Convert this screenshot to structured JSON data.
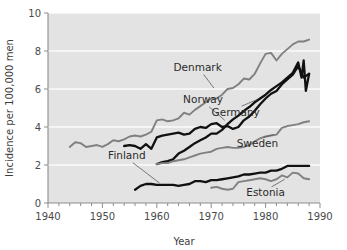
{
  "chart_data": {
    "type": "line",
    "title": "",
    "xlabel": "Year",
    "ylabel": "Incidence per 100,000 men",
    "xlim": [
      1940,
      1990
    ],
    "ylim": [
      0,
      10
    ],
    "xticks": [
      1940,
      1950,
      1960,
      1970,
      1980,
      1990
    ],
    "xtick_labels": [
      "1940",
      "1950",
      "1960",
      "1970",
      "1980",
      "1990"
    ],
    "yticks": [
      0,
      2,
      4,
      6,
      8,
      10
    ],
    "ytick_labels": [
      "0",
      "2",
      "4",
      "6",
      "8",
      "10"
    ],
    "minor_xtick_interval": 2,
    "grid": "horizontal-white",
    "legend": "inline-annotations",
    "plot_background": "#e3e3e3",
    "figure_background": "#ffffff",
    "series": [
      {
        "name": "Denmark",
        "color": "#808080",
        "label_x": 1967.5,
        "label_y": 6.95,
        "leader_to_x": 1970.5,
        "leader_to_y": 6.05,
        "x": [
          1944,
          1945,
          1946,
          1947,
          1948,
          1949,
          1950,
          1951,
          1952,
          1953,
          1954,
          1955,
          1956,
          1957,
          1958,
          1959,
          1960,
          1961,
          1962,
          1963,
          1964,
          1965,
          1966,
          1967,
          1968,
          1969,
          1970,
          1971,
          1972,
          1973,
          1974,
          1975,
          1976,
          1977,
          1978,
          1979,
          1980,
          1981,
          1982,
          1983,
          1984,
          1985,
          1986,
          1987,
          1988
        ],
        "y": [
          2.95,
          3.2,
          3.15,
          2.95,
          3.0,
          3.05,
          2.95,
          3.1,
          3.3,
          3.25,
          3.35,
          3.5,
          3.55,
          3.5,
          3.6,
          3.75,
          4.35,
          4.4,
          4.3,
          4.35,
          4.45,
          4.75,
          4.65,
          4.9,
          5.1,
          5.3,
          5.5,
          5.5,
          5.7,
          6.0,
          6.05,
          6.25,
          6.55,
          6.5,
          6.8,
          7.35,
          7.85,
          7.9,
          7.5,
          7.85,
          8.1,
          8.35,
          8.5,
          8.5,
          8.6
        ]
      },
      {
        "name": "Norway",
        "color": "#111111",
        "label_x": 1968.5,
        "label_y": 5.25,
        "leader_to_x": 1972.5,
        "leader_to_y": 4.35,
        "x": [
          1954,
          1955,
          1956,
          1957,
          1958,
          1959,
          1960,
          1961,
          1962,
          1963,
          1964,
          1965,
          1966,
          1967,
          1968,
          1969,
          1970,
          1971,
          1972,
          1973,
          1974,
          1975,
          1976,
          1977,
          1978,
          1979,
          1980,
          1981,
          1982,
          1983,
          1984,
          1985,
          1986,
          1987,
          1988
        ],
        "y": [
          3.0,
          3.05,
          3.0,
          2.85,
          3.1,
          2.85,
          3.45,
          3.55,
          3.6,
          3.65,
          3.7,
          3.6,
          3.65,
          3.9,
          4.0,
          3.95,
          4.15,
          4.2,
          4.0,
          4.05,
          3.9,
          4.0,
          4.35,
          4.55,
          4.85,
          5.2,
          5.5,
          5.75,
          5.9,
          6.25,
          6.5,
          6.75,
          7.2,
          6.6,
          6.8
        ]
      },
      {
        "name": "Germany",
        "color": "#111111",
        "label_x": 1974.5,
        "label_y": 4.6,
        "leader_to_x": 1978.5,
        "leader_to_y": 5.45,
        "x": [
          1960,
          1961,
          1962,
          1963,
          1964,
          1965,
          1966,
          1967,
          1968,
          1969,
          1970,
          1971,
          1972,
          1973,
          1974,
          1975,
          1976,
          1977,
          1978,
          1979,
          1980,
          1981,
          1982,
          1983,
          1984,
          1985,
          1986,
          1986.6,
          1987,
          1987.4,
          1988
        ],
        "y": [
          2.05,
          2.15,
          2.2,
          2.3,
          2.6,
          2.75,
          2.95,
          3.15,
          3.3,
          3.45,
          3.65,
          3.65,
          3.85,
          4.15,
          4.4,
          4.6,
          4.85,
          5.05,
          5.3,
          5.5,
          5.7,
          5.95,
          6.15,
          6.35,
          6.6,
          6.85,
          7.4,
          6.6,
          7.5,
          5.9,
          6.8
        ]
      },
      {
        "name": "Sweden",
        "color": "#808080",
        "label_x": 1978.5,
        "label_y": 2.95,
        "leader_to_x": 1981.5,
        "leader_to_y": 3.6,
        "x": [
          1960,
          1961,
          1962,
          1963,
          1964,
          1965,
          1966,
          1967,
          1968,
          1969,
          1970,
          1971,
          1972,
          1973,
          1974,
          1975,
          1976,
          1977,
          1978,
          1979,
          1980,
          1981,
          1982,
          1983,
          1984,
          1985,
          1986,
          1987,
          1988
        ],
        "y": [
          2.05,
          2.1,
          2.1,
          2.2,
          2.25,
          2.3,
          2.4,
          2.5,
          2.6,
          2.65,
          2.7,
          2.85,
          2.9,
          2.95,
          2.9,
          2.9,
          2.95,
          3.05,
          3.25,
          3.4,
          3.5,
          3.55,
          3.6,
          3.95,
          4.05,
          4.1,
          4.15,
          4.25,
          4.3
        ]
      },
      {
        "name": "Finland",
        "color": "#111111",
        "label_x": 1954.5,
        "label_y": 2.3,
        "leader_to_x": 1960.5,
        "leader_to_y": 1.05,
        "x": [
          1956,
          1957,
          1958,
          1959,
          1960,
          1961,
          1962,
          1963,
          1964,
          1965,
          1966,
          1967,
          1968,
          1969,
          1970,
          1971,
          1972,
          1973,
          1974,
          1975,
          1976,
          1977,
          1978,
          1979,
          1980,
          1981,
          1982,
          1983,
          1984,
          1985,
          1986,
          1987,
          1988
        ],
        "y": [
          0.7,
          0.9,
          1.0,
          1.0,
          0.95,
          0.95,
          0.95,
          0.95,
          0.9,
          0.95,
          1.0,
          1.15,
          1.15,
          1.1,
          1.2,
          1.2,
          1.25,
          1.3,
          1.35,
          1.4,
          1.5,
          1.5,
          1.55,
          1.6,
          1.6,
          1.7,
          1.7,
          1.8,
          1.95,
          1.95,
          1.95,
          1.95,
          1.95
        ]
      },
      {
        "name": "Estonia",
        "color": "#808080",
        "label_x": 1980.0,
        "label_y": 0.35,
        "leader_to_x": 1983.5,
        "leader_to_y": 1.25,
        "x": [
          1970,
          1971,
          1972,
          1973,
          1974,
          1975,
          1976,
          1977,
          1978,
          1979,
          1980,
          1981,
          1982,
          1983,
          1984,
          1985,
          1986,
          1987,
          1988
        ],
        "y": [
          0.8,
          0.85,
          0.75,
          0.7,
          0.75,
          1.1,
          1.15,
          1.2,
          1.25,
          1.3,
          1.25,
          1.15,
          1.25,
          1.45,
          1.35,
          1.6,
          1.55,
          1.3,
          1.25
        ]
      }
    ]
  }
}
